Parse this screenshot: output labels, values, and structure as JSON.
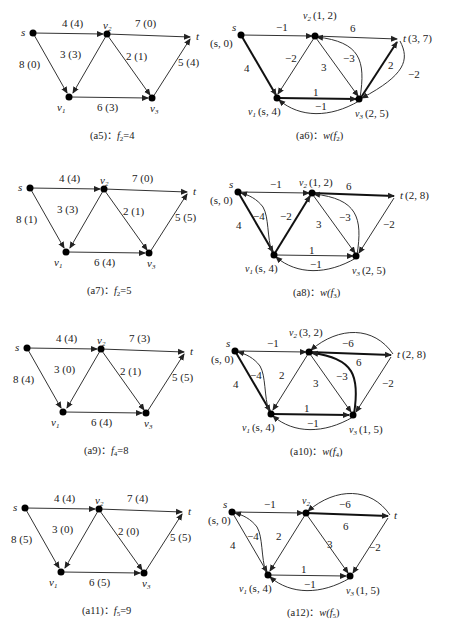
{
  "panels": [
    {
      "id": "a5",
      "caption_prefix": "(a5)：",
      "caption_fn": "f",
      "caption_sub": "2",
      "caption_suffix": "=4",
      "type": "flow",
      "edges": [
        {
          "from": "s",
          "to": "v2",
          "label": "4 (4)"
        },
        {
          "from": "v2",
          "to": "t",
          "label": "7 (0)"
        },
        {
          "from": "s",
          "to": "v1",
          "label": "8 (0)"
        },
        {
          "from": "v2",
          "to": "v1",
          "label": "3 (3)"
        },
        {
          "from": "v2",
          "to": "v3",
          "label": "2 (1)"
        },
        {
          "from": "v1",
          "to": "v3",
          "label": "6 (3)"
        },
        {
          "from": "v3",
          "to": "t",
          "label": "5 (4)"
        }
      ]
    },
    {
      "id": "a6",
      "caption_prefix": "(a6)：",
      "caption_fn": "w(f",
      "caption_sub": "2",
      "caption_suffix": ")",
      "type": "residual",
      "node_labels": {
        "s": "s",
        "s_mark": "(s, 0)",
        "v1": "(s, 4)",
        "v2": "(1, 2)",
        "v3": "(2, 5)",
        "t": "(3, 7)"
      },
      "edges": [
        {
          "from": "s",
          "to": "v2",
          "label": "−1"
        },
        {
          "from": "v2",
          "to": "t",
          "label": "6"
        },
        {
          "from": "s",
          "to": "v1",
          "label": "4",
          "bold": true
        },
        {
          "from": "v2",
          "to": "v1",
          "label": "−2"
        },
        {
          "from": "v2",
          "to": "v3",
          "label": "3"
        },
        {
          "from": "v3",
          "to": "v2",
          "label": "−3",
          "curved": true
        },
        {
          "from": "v1",
          "to": "v3",
          "label": "1",
          "bold": true
        },
        {
          "from": "v3",
          "to": "v1",
          "label": "−1",
          "curved": true
        },
        {
          "from": "v3",
          "to": "t",
          "label": "2",
          "bold": true
        },
        {
          "from": "t",
          "to": "v3",
          "label": "−2",
          "curved": true
        }
      ]
    },
    {
      "id": "a7",
      "caption_prefix": "(a7)：",
      "caption_fn": "f",
      "caption_sub": "2",
      "caption_suffix": "=5",
      "type": "flow",
      "edges": [
        {
          "from": "s",
          "to": "v2",
          "label": "4 (4)"
        },
        {
          "from": "v2",
          "to": "t",
          "label": "7 (0)"
        },
        {
          "from": "s",
          "to": "v1",
          "label": "8 (1)"
        },
        {
          "from": "v2",
          "to": "v1",
          "label": "3 (3)"
        },
        {
          "from": "v2",
          "to": "v3",
          "label": "2 (1)"
        },
        {
          "from": "v1",
          "to": "v3",
          "label": "6 (4)"
        },
        {
          "from": "v3",
          "to": "t",
          "label": "5 (5)"
        }
      ]
    },
    {
      "id": "a8",
      "caption_prefix": "(a8)：",
      "caption_fn": "w(f",
      "caption_sub": "3",
      "caption_suffix": ")",
      "type": "residual",
      "node_labels": {
        "s": "s",
        "s_mark": "(s, 0)",
        "v1": "(s, 4)",
        "v2": "(1, 2)",
        "v3": "(2, 5)",
        "t": "(2, 8)"
      },
      "edges": [
        {
          "from": "s",
          "to": "v2",
          "label": "−1"
        },
        {
          "from": "v2",
          "to": "t",
          "label": "6",
          "bold": true
        },
        {
          "from": "s",
          "to": "v1",
          "label": "4",
          "bold": true
        },
        {
          "from": "v1",
          "to": "s",
          "label": "−4",
          "curved": true
        },
        {
          "from": "v1",
          "to": "v2",
          "label": "−2",
          "bold": true
        },
        {
          "from": "v2",
          "to": "v3",
          "label": "3"
        },
        {
          "from": "v3",
          "to": "v2",
          "label": "−3",
          "curved": true
        },
        {
          "from": "v1",
          "to": "v3",
          "label": "1"
        },
        {
          "from": "v3",
          "to": "v1",
          "label": "−1",
          "curved": true
        },
        {
          "from": "t",
          "to": "v3",
          "label": "−2"
        }
      ]
    },
    {
      "id": "a9",
      "caption_prefix": "(a9)：",
      "caption_fn": "f",
      "caption_sub": "4",
      "caption_suffix": "=8",
      "type": "flow",
      "edges": [
        {
          "from": "s",
          "to": "v2",
          "label": "4 (4)"
        },
        {
          "from": "v2",
          "to": "t",
          "label": "7 (3)"
        },
        {
          "from": "s",
          "to": "v1",
          "label": "8 (4)"
        },
        {
          "from": "v2",
          "to": "v1",
          "label": "3 (0)"
        },
        {
          "from": "v2",
          "to": "v3",
          "label": "2 (1)"
        },
        {
          "from": "v1",
          "to": "v3",
          "label": "6 (4)"
        },
        {
          "from": "v3",
          "to": "t",
          "label": "5 (5)"
        }
      ]
    },
    {
      "id": "a10",
      "caption_prefix": "(a10)：",
      "caption_fn": "w(f",
      "caption_sub": "4",
      "caption_suffix": ")",
      "type": "residual",
      "node_labels": {
        "s": "s",
        "s_mark": "(s, 0)",
        "v1": "(s, 4)",
        "v2": "(3, 2)",
        "v3": "(1, 5)",
        "t": "(2, 8)"
      },
      "edges": [
        {
          "from": "s",
          "to": "v2",
          "label": "−1"
        },
        {
          "from": "v2",
          "to": "t",
          "label": "6",
          "bold": true
        },
        {
          "from": "t",
          "to": "v2",
          "label": "−6",
          "curved": true
        },
        {
          "from": "s",
          "to": "v1",
          "label": "4",
          "bold": true
        },
        {
          "from": "v1",
          "to": "s",
          "label": "−4",
          "curved": true
        },
        {
          "from": "v2",
          "to": "v1",
          "label": "2"
        },
        {
          "from": "v2",
          "to": "v3",
          "label": "3"
        },
        {
          "from": "v3",
          "to": "v2",
          "label": "−3",
          "curved": true,
          "bold": true
        },
        {
          "from": "v1",
          "to": "v3",
          "label": "1",
          "bold": true
        },
        {
          "from": "v3",
          "to": "v1",
          "label": "−1",
          "curved": true
        },
        {
          "from": "t",
          "to": "v3",
          "label": "−2"
        }
      ]
    },
    {
      "id": "a11",
      "caption_prefix": "(a11)：",
      "caption_fn": "f",
      "caption_sub": "5",
      "caption_suffix": "=9",
      "type": "flow",
      "edges": [
        {
          "from": "s",
          "to": "v2",
          "label": "4 (4)"
        },
        {
          "from": "v2",
          "to": "t",
          "label": "7 (4)"
        },
        {
          "from": "s",
          "to": "v1",
          "label": "8 (5)"
        },
        {
          "from": "v2",
          "to": "v1",
          "label": "3 (0)"
        },
        {
          "from": "v2",
          "to": "v3",
          "label": "2 (0)"
        },
        {
          "from": "v1",
          "to": "v3",
          "label": "6 (5)"
        },
        {
          "from": "v3",
          "to": "t",
          "label": "5 (5)"
        }
      ]
    },
    {
      "id": "a12",
      "caption_prefix": "(a12)：",
      "caption_fn": "w(f",
      "caption_sub": "5",
      "caption_suffix": ")",
      "type": "residual",
      "node_labels": {
        "s": "s",
        "s_mark": "(s, 0)",
        "v1": "(s, 4)",
        "v2": "",
        "v3": "(1, 5)",
        "t": ""
      },
      "edges": [
        {
          "from": "s",
          "to": "v2",
          "label": "−1"
        },
        {
          "from": "v2",
          "to": "t",
          "label": "6",
          "bold": true
        },
        {
          "from": "t",
          "to": "v2",
          "label": "−6",
          "curved": true
        },
        {
          "from": "s",
          "to": "v1",
          "label": "4"
        },
        {
          "from": "v1",
          "to": "s",
          "label": "−4",
          "curved": true
        },
        {
          "from": "v2",
          "to": "v1",
          "label": "2"
        },
        {
          "from": "v2",
          "to": "v3",
          "label": "3"
        },
        {
          "from": "v1",
          "to": "v3",
          "label": "1"
        },
        {
          "from": "v3",
          "to": "v1",
          "label": "−1",
          "curved": true
        },
        {
          "from": "t",
          "to": "v3",
          "label": "−2"
        }
      ]
    }
  ],
  "node_names": {
    "s": "s",
    "t": "t",
    "v1": "v",
    "v2": "v",
    "v3": "v",
    "v1_sub": "1",
    "v2_sub": "2",
    "v3_sub": "3"
  }
}
